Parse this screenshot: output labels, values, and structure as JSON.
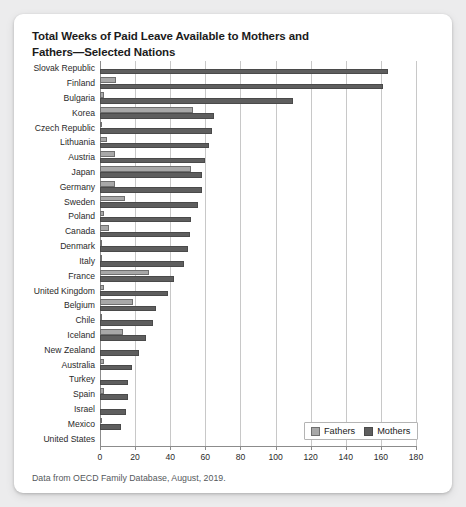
{
  "card": {
    "title": "Total Weeks of Paid Leave Available to Mothers and Fathers—Selected Nations",
    "caption": "Data from OECD Family Database, August, 2019."
  },
  "legend": {
    "position": "bottom-right",
    "items": [
      {
        "label": "Fathers",
        "color": "#a8a8a8",
        "key": "fathers"
      },
      {
        "label": "Mothers",
        "color": "#5e5e5e",
        "key": "mothers"
      }
    ]
  },
  "axis": {
    "ticks": [
      0,
      20,
      40,
      60,
      80,
      100,
      120,
      140,
      160,
      180
    ]
  },
  "chart_data": {
    "type": "bar",
    "orientation": "horizontal",
    "title": "Total Weeks of Paid Leave Available to Mothers and Fathers—Selected Nations",
    "xlabel": "",
    "ylabel": "",
    "xlim": [
      0,
      180
    ],
    "grid": true,
    "legend_position": "bottom-right",
    "categories": [
      "Slovak Republic",
      "Finland",
      "Bulgaria",
      "Korea",
      "Czech Republic",
      "Lithuania",
      "Austria",
      "Japan",
      "Germany",
      "Sweden",
      "Poland",
      "Canada",
      "Denmark",
      "Italy",
      "France",
      "United Kingdom",
      "Belgium",
      "Chile",
      "Iceland",
      "New Zealand",
      "Australia",
      "Turkey",
      "Spain",
      "Israel",
      "Mexico",
      "United States"
    ],
    "series": [
      {
        "name": "Fathers",
        "color": "#a8a8a8",
        "values": [
          0,
          9,
          2,
          53,
          1,
          4,
          8.7,
          52,
          8.7,
          14,
          2,
          5,
          1,
          0.2,
          28,
          2,
          19,
          1,
          13,
          0,
          2,
          0,
          2,
          0,
          1,
          0
        ]
      },
      {
        "name": "Mothers",
        "color": "#5e5e5e",
        "values": [
          164,
          161,
          110,
          64.9,
          64,
          62,
          60,
          58,
          58,
          56,
          52,
          51,
          50,
          47.7,
          42,
          39,
          32,
          30,
          26,
          22,
          18,
          16,
          16,
          15,
          12,
          0
        ]
      }
    ],
    "units": "weeks"
  }
}
